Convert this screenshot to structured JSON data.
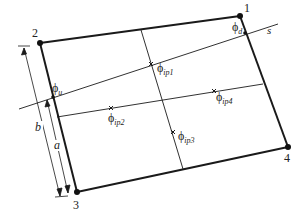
{
  "diagram": {
    "nodes": [
      {
        "id": "1",
        "label": "1",
        "x": 240,
        "y": 16
      },
      {
        "id": "2",
        "label": "2",
        "x": 40,
        "y": 43
      },
      {
        "id": "3",
        "label": "3",
        "x": 77,
        "y": 192
      },
      {
        "id": "4",
        "label": "4",
        "x": 288,
        "y": 147
      }
    ],
    "line_label": "s",
    "phi_symbol": "ϕ",
    "points": {
      "phi_u": {
        "sub": "u"
      },
      "phi_d": {
        "sub": "d"
      },
      "phi_ip1": {
        "sub": "ip1"
      },
      "phi_ip2": {
        "sub": "ip2"
      },
      "phi_ip3": {
        "sub": "ip3"
      },
      "phi_ip4": {
        "sub": "ip4"
      }
    },
    "dimensions": {
      "a": "a",
      "b": "b"
    },
    "colors": {
      "stroke": "#1a1a1a",
      "background": "#ffffff"
    }
  }
}
